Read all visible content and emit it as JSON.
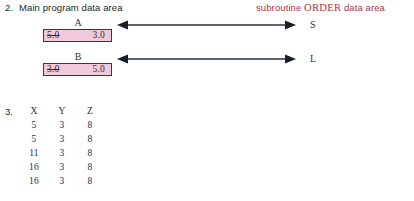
{
  "item2": {
    "number": "2.",
    "title": "Main program data area",
    "subroutine_title_prefix": "subroutine ",
    "subroutine_name": "ORDER",
    "subroutine_title_suffix": " data area",
    "subroutine_title_color": "#a23a4a",
    "box_fill_color": "#f0cada",
    "box_border_color": "#3b3446",
    "rows": [
      {
        "var_label": "A",
        "old_value": "5.0",
        "new_value": "3.0",
        "side_label": "S",
        "arrow": "double-headed"
      },
      {
        "var_label": "B",
        "old_value": "3.0",
        "new_value": "5.0",
        "side_label": "L",
        "arrow": "double-headed"
      }
    ]
  },
  "item3": {
    "number": "3.",
    "columns": [
      "X",
      "Y",
      "Z"
    ],
    "rows": [
      [
        "5",
        "3",
        "8"
      ],
      [
        "5",
        "3",
        "8"
      ],
      [
        "11",
        "3",
        "8"
      ],
      [
        "16",
        "3",
        "8"
      ],
      [
        "16",
        "3",
        "8"
      ]
    ]
  }
}
